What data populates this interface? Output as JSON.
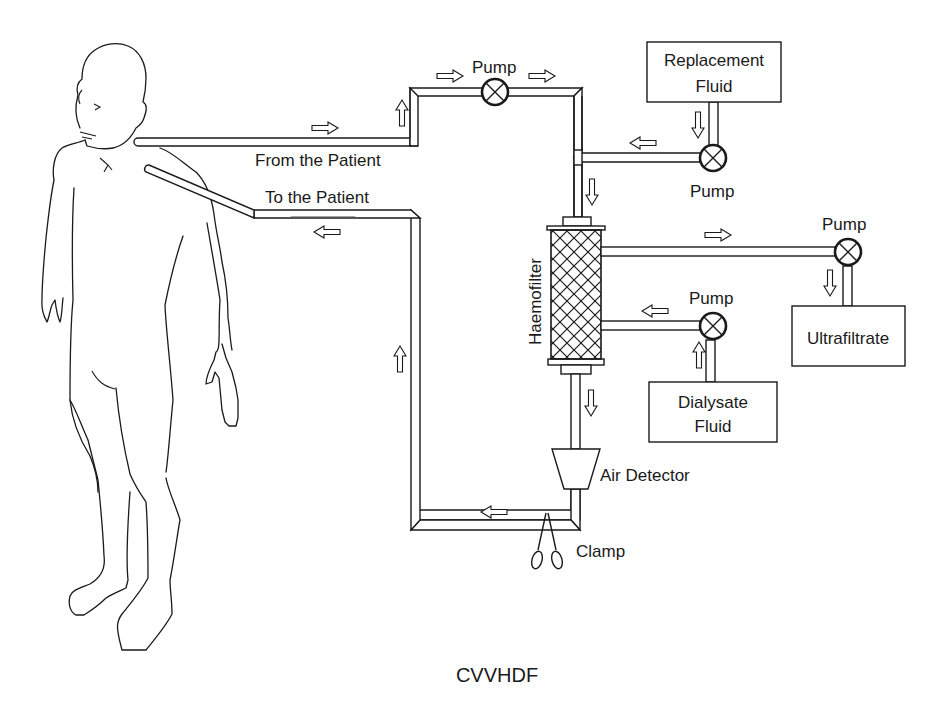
{
  "diagram": {
    "title": "CVVHDF",
    "labels": {
      "from_patient": "From the Patient",
      "to_patient": "To the Patient",
      "blood_pump": "Pump",
      "replacement_pump": "Pump",
      "ultrafiltrate_pump": "Pump",
      "dialysate_pump": "Pump",
      "haemofilter": "Haemofilter",
      "air_detector": "Air Detector",
      "clamp": "Clamp"
    },
    "boxes": {
      "replacement_fluid": [
        "Replacement",
        "Fluid"
      ],
      "ultrafiltrate": [
        "Ultrafiltrate"
      ],
      "dialysate_fluid": [
        "Dialysate",
        "Fluid"
      ]
    },
    "icons": {
      "pump": "pump-icon",
      "flow_arrow": "flow-arrow-icon",
      "clamp": "scissors-clamp-icon",
      "air_detector": "trapezoid-icon",
      "haemofilter": "crosshatch-cylinder-icon",
      "patient": "human-figure-outline"
    },
    "colors": {
      "stroke": "#1a1a1a",
      "background": "#ffffff"
    }
  }
}
